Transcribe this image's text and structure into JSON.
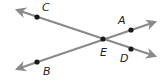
{
  "diagram": {
    "type": "intersecting-lines",
    "colors": {
      "line": "#8a8a8a",
      "point": "#1a1a1a",
      "label": "#222222"
    },
    "points": {
      "C": {
        "label": "C",
        "x": 37,
        "y": 17,
        "lx": 42,
        "ly": 11
      },
      "A": {
        "label": "A",
        "x": 131,
        "y": 30,
        "lx": 118,
        "ly": 24
      },
      "E": {
        "label": "E",
        "x": 103,
        "y": 39,
        "lx": 100,
        "ly": 56
      },
      "D": {
        "label": "D",
        "x": 131,
        "y": 49,
        "lx": 120,
        "ly": 62
      },
      "B": {
        "label": "B",
        "x": 37,
        "y": 62,
        "lx": 43,
        "ly": 75
      }
    },
    "lines": [
      {
        "name": "line-CD",
        "through": [
          "C",
          "E",
          "D"
        ],
        "x1": 17,
        "y1": 10,
        "x2": 155,
        "y2": 56
      },
      {
        "name": "line-BA",
        "through": [
          "B",
          "E",
          "A"
        ],
        "x1": 17,
        "y1": 69,
        "x2": 155,
        "y2": 22
      }
    ]
  }
}
